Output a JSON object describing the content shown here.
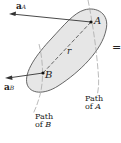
{
  "diagram": {
    "labels": {
      "aA_main": "a",
      "aA_sub": "A",
      "aB_main": "a",
      "aB_sub": "B",
      "pointA": "A",
      "pointB": "B",
      "r": "r",
      "equals": "=",
      "pathA_line1": "Path",
      "pathA_line2": "of",
      "pathA_letter": "A",
      "pathB_line1": "Path",
      "pathB_line2": "of",
      "pathB_letter": "B"
    },
    "colors": {
      "body_fill": "#e6e6e6",
      "outline": "#555555",
      "vector": "#333333",
      "path_dashed": "#999999"
    }
  }
}
